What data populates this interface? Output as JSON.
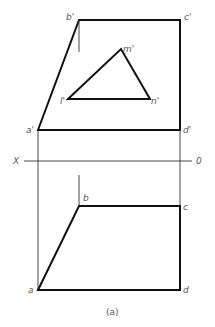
{
  "diagram": {
    "type": "orthographic-projection",
    "caption": "(a)",
    "axis": {
      "left_label": "X",
      "right_label": "0",
      "y": 161,
      "x1": 22,
      "x2": 193
    },
    "front_view": {
      "quad_points": {
        "a'": [
          38,
          130
        ],
        "b'": [
          79,
          20
        ],
        "c'": [
          180,
          20
        ],
        "d'": [
          180,
          130
        ]
      },
      "triangle_points": {
        "l'": [
          68,
          99
        ],
        "m'": [
          121,
          49
        ],
        "n'": [
          150,
          99
        ]
      },
      "labels": {
        "a": "a'",
        "b": "b'",
        "c": "c'",
        "d": "d'",
        "l": "l'",
        "m": "m'",
        "n": "n'"
      },
      "helper_line": {
        "x": 79,
        "y1": 20,
        "y2": 52
      }
    },
    "top_view": {
      "quad_points": {
        "a": [
          38,
          290
        ],
        "b": [
          79,
          206
        ],
        "c": [
          180,
          206
        ],
        "d": [
          180,
          290
        ]
      },
      "labels": {
        "a": "a",
        "b": "b",
        "c": "c",
        "d": "d"
      },
      "helper_line": {
        "x": 79,
        "y1": 175,
        "y2": 206
      }
    },
    "projection_lines": [
      {
        "x": 38,
        "y1": 130,
        "y2": 290
      },
      {
        "x": 180,
        "y1": 130,
        "y2": 206
      }
    ],
    "colors": {
      "thick_line": "#111111",
      "thin_line": "#333333",
      "label": "#555555",
      "background": "#ffffff"
    }
  }
}
